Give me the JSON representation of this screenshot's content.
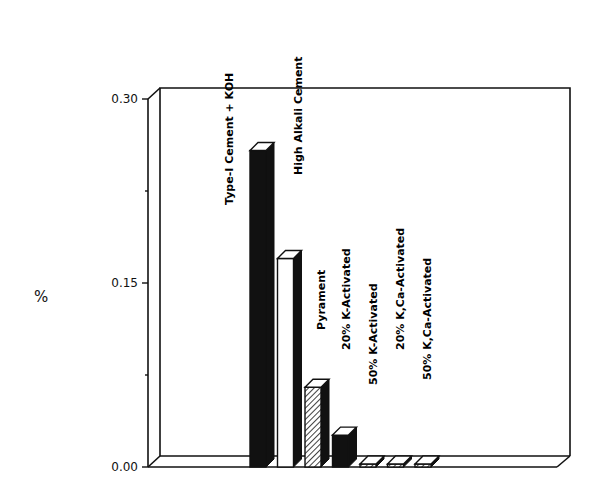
{
  "chart_data": {
    "type": "bar",
    "style": "3d",
    "title": "",
    "xlabel": "",
    "ylabel": "%",
    "ylim": [
      0,
      0.3
    ],
    "yticks": [
      "0.00",
      "0.15",
      "0.30"
    ],
    "minor_ticks": [
      0.075,
      0.225
    ],
    "grid": false,
    "legend": "none (categories labeled with vertical text above bars)",
    "categories": [
      "Type-I Cement + KOH",
      "High Alkali Cement",
      "Pyrament",
      "20% K-Activated",
      "50% K-Activated",
      "20% K,Ca-Activated",
      "50% K,Ca-Activated"
    ],
    "values": [
      0.258,
      0.17,
      0.065,
      0.026,
      0.0,
      0.0,
      0.0
    ],
    "fills": [
      "solid-black",
      "white",
      "hatched",
      "solid-black",
      "hatched",
      "hatched",
      "hatched"
    ]
  },
  "colors": {
    "ink": "#111111",
    "background": "#ffffff"
  }
}
